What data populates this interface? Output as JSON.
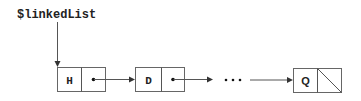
{
  "diagram": {
    "type": "linked-list",
    "head_pointer": {
      "label": "$linkedList"
    },
    "nodes": [
      {
        "value": "H",
        "next": "pointer"
      },
      {
        "value": "D",
        "next": "pointer"
      },
      {
        "value": "Q",
        "next": "null"
      }
    ],
    "ellipsis": "• • •",
    "colors": {
      "stroke": "#666666",
      "text": "#222222",
      "background": "#ffffff"
    }
  }
}
